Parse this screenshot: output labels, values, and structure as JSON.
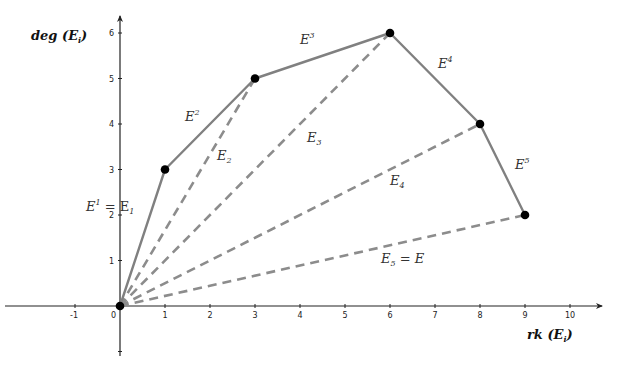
{
  "diagram": {
    "type": "harder-narasimhan-polygon",
    "axes": {
      "x_label": "rk (E",
      "x_label_sub": "i",
      "x_label_close": ")",
      "y_label": "deg (E",
      "y_label_sub": "i",
      "y_label_close": ")",
      "x_ticks": [
        "-1",
        "0",
        "1",
        "2",
        "3",
        "4",
        "5",
        "6",
        "7",
        "8",
        "9",
        "10"
      ],
      "y_ticks": [
        "1",
        "2",
        "3",
        "4",
        "5",
        "6"
      ],
      "xlim": [
        -2.6,
        10.7
      ],
      "ylim": [
        -1.1,
        6.3
      ]
    },
    "vertices": [
      {
        "x": 0,
        "y": 0
      },
      {
        "x": 1,
        "y": 3
      },
      {
        "x": 3,
        "y": 5
      },
      {
        "x": 6,
        "y": 6
      },
      {
        "x": 8,
        "y": 4
      },
      {
        "x": 9,
        "y": 2
      }
    ],
    "polygon_edges": [
      {
        "label": "E",
        "sup": "1",
        "suffix": " = E",
        "suffix_sub": "1"
      },
      {
        "label": "E",
        "sup": "2"
      },
      {
        "label": "E",
        "sup": "3"
      },
      {
        "label": "E",
        "sup": "4"
      },
      {
        "label": "E",
        "sup": "5"
      }
    ],
    "dashed_chords": [
      {
        "label": "E",
        "sub": "2"
      },
      {
        "label": "E",
        "sub": "3"
      },
      {
        "label": "E",
        "sub": "4"
      },
      {
        "label": "E",
        "sub": "5",
        "suffix": " = E"
      }
    ],
    "colors": {
      "axis": "#222222",
      "polygon": "#808080",
      "dashed": "#8c8c8c",
      "vertex": "#000000"
    }
  }
}
